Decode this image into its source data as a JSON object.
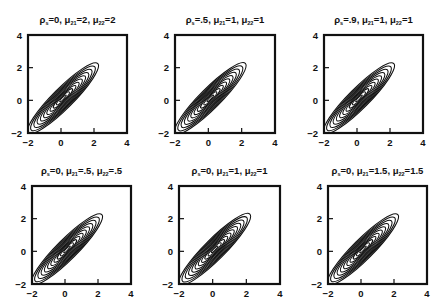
{
  "figure": {
    "background": "#ffffff",
    "line_color": "#111111"
  },
  "chart_data": [
    {
      "type": "contour",
      "title": "ρ_s=0, μ_21=2, μ_22=2",
      "title_parts": {
        "rho": "ρ",
        "rho_sub": "s",
        "rho_val": "=0, ",
        "mu1": "μ",
        "mu1_sub": "21",
        "mu1_val": "=2, ",
        "mu2": "μ",
        "mu2_sub": "22",
        "mu2_val": "=2"
      },
      "xlim": [
        -2,
        4
      ],
      "ylim": [
        -2,
        4
      ],
      "xticks": [
        -2,
        0,
        2,
        4
      ],
      "yticks": [
        -2,
        0,
        2,
        4
      ],
      "center": [
        0,
        0
      ],
      "angle_deg": 45,
      "n_levels": 11,
      "outer_semi_axes": [
        3.0,
        0.62
      ],
      "frame": {
        "x": 28,
        "y": 35,
        "w": 99,
        "h": 98
      }
    },
    {
      "type": "contour",
      "title": "ρ_s=.5, μ_21=1, μ_22=1",
      "title_parts": {
        "rho": "ρ",
        "rho_sub": "s",
        "rho_val": "=.5, ",
        "mu1": "μ",
        "mu1_sub": "21",
        "mu1_val": "=1, ",
        "mu2": "μ",
        "mu2_sub": "22",
        "mu2_val": "=1"
      },
      "xlim": [
        -2,
        4
      ],
      "ylim": [
        -2,
        4
      ],
      "xticks": [
        -2,
        0,
        2,
        4
      ],
      "yticks": [
        -2,
        0,
        2,
        4
      ],
      "center": [
        0,
        0
      ],
      "angle_deg": 45,
      "n_levels": 11,
      "outer_semi_axes": [
        3.0,
        0.62
      ],
      "frame": {
        "x": 175,
        "y": 35,
        "w": 100,
        "h": 98
      }
    },
    {
      "type": "contour",
      "title": "ρ_s=.9, μ_21=1, μ_22=1",
      "title_parts": {
        "rho": "ρ",
        "rho_sub": "s",
        "rho_val": "=.9, ",
        "mu1": "μ",
        "mu1_sub": "21",
        "mu1_val": "=1, ",
        "mu2": "μ",
        "mu2_sub": "22",
        "mu2_val": "=1"
      },
      "xlim": [
        -2,
        4
      ],
      "ylim": [
        -2,
        4
      ],
      "xticks": [
        -2,
        0,
        2,
        4
      ],
      "yticks": [
        -2,
        0,
        2,
        4
      ],
      "center": [
        0,
        0
      ],
      "angle_deg": 45,
      "n_levels": 11,
      "outer_semi_axes": [
        3.0,
        0.62
      ],
      "frame": {
        "x": 324,
        "y": 35,
        "w": 99,
        "h": 98
      }
    },
    {
      "type": "contour",
      "title": "ρ_s=0, μ_21=.5, μ_22=.5",
      "title_parts": {
        "rho": "ρ",
        "rho_sub": "s",
        "rho_val": "=0, ",
        "mu1": "μ",
        "mu1_sub": "21",
        "mu1_val": "=.5, ",
        "mu2": "μ",
        "mu2_sub": "22",
        "mu2_val": "=.5"
      },
      "xlim": [
        -2,
        4
      ],
      "ylim": [
        -2,
        4
      ],
      "xticks": [
        -2,
        0,
        2,
        4
      ],
      "yticks": [
        -2,
        0,
        2,
        4
      ],
      "center": [
        0,
        0
      ],
      "angle_deg": 45,
      "n_levels": 11,
      "outer_semi_axes": [
        3.0,
        0.62
      ],
      "frame": {
        "x": 32,
        "y": 186,
        "w": 99,
        "h": 98
      }
    },
    {
      "type": "contour",
      "title": "ρ_s=0, μ_21=1, μ_22=1",
      "title_parts": {
        "rho": "ρ",
        "rho_sub": "s",
        "rho_val": "=0, ",
        "mu1": "μ",
        "mu1_sub": "21",
        "mu1_val": "=1, ",
        "mu2": "μ",
        "mu2_sub": "22",
        "mu2_val": "=1"
      },
      "xlim": [
        -2,
        4
      ],
      "ylim": [
        -2,
        4
      ],
      "xticks": [
        -2,
        0,
        2,
        4
      ],
      "yticks": [
        -2,
        0,
        2,
        4
      ],
      "center": [
        0,
        0
      ],
      "angle_deg": 45,
      "n_levels": 11,
      "outer_semi_axes": [
        3.0,
        0.62
      ],
      "frame": {
        "x": 179,
        "y": 186,
        "w": 101,
        "h": 98
      }
    },
    {
      "type": "contour",
      "title": "ρ_s=0, μ_21=1.5, μ_22=1.5",
      "title_parts": {
        "rho": "ρ",
        "rho_sub": "s",
        "rho_val": "=0, ",
        "mu1": "μ",
        "mu1_sub": "21",
        "mu1_val": "=1.5, ",
        "mu2": "μ",
        "mu2_sub": "22",
        "mu2_val": "=1.5"
      },
      "xlim": [
        -2,
        4
      ],
      "ylim": [
        -2,
        4
      ],
      "xticks": [
        -2,
        0,
        2,
        4
      ],
      "yticks": [
        -2,
        0,
        2,
        4
      ],
      "center": [
        0,
        0
      ],
      "angle_deg": 45,
      "n_levels": 11,
      "outer_semi_axes": [
        3.0,
        0.62
      ],
      "frame": {
        "x": 328,
        "y": 186,
        "w": 99,
        "h": 98
      }
    }
  ]
}
